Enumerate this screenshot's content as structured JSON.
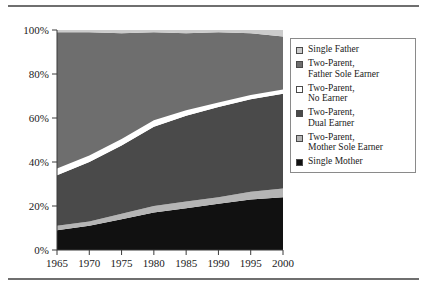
{
  "chart_data": {
    "type": "area",
    "stacked": true,
    "title": "",
    "subtitle": "",
    "xlabel": "",
    "ylabel": "",
    "x": [
      1965,
      1970,
      1975,
      1980,
      1985,
      1990,
      1995,
      2000
    ],
    "xtick_labels": [
      "1965",
      "1970",
      "1975",
      "1980",
      "1985",
      "1990",
      "1995",
      "2000"
    ],
    "xlim": [
      1965,
      2000
    ],
    "ylim": [
      0,
      100
    ],
    "ytick_labels": [
      "0%",
      "20%",
      "40%",
      "60%",
      "80%",
      "100%"
    ],
    "yticks": [
      0,
      20,
      40,
      60,
      80,
      100
    ],
    "grid": false,
    "legend_position": "right",
    "stack_order_bottom_to_top": [
      "Single Mother",
      "Two-Parent, Mother Sole Earner",
      "Two-Parent, Dual Earner",
      "Two-Parent, No Earner",
      "Two-Parent, Father Sole Earner",
      "Single Father"
    ],
    "series": [
      {
        "name": "Single Mother",
        "color": "#111111",
        "values": [
          9,
          11,
          14,
          17,
          19,
          21,
          23,
          24
        ]
      },
      {
        "name": "Two-Parent, Mother Sole Earner",
        "color": "#b5b5b5",
        "values": [
          2,
          2,
          2.5,
          3,
          3,
          3,
          3.5,
          4
        ]
      },
      {
        "name": "Two-Parent, Dual Earner",
        "color": "#4a4a4a",
        "values": [
          23,
          27,
          31,
          36,
          39,
          41,
          42,
          43
        ]
      },
      {
        "name": "Two-Parent, No Earner",
        "color": "#ffffff",
        "values": [
          3,
          3,
          3,
          3,
          2.5,
          2,
          2,
          2
        ]
      },
      {
        "name": "Two-Parent, Father Sole Earner",
        "color": "#6e6e6e",
        "values": [
          62,
          56,
          48,
          40,
          35,
          32,
          28,
          24
        ]
      },
      {
        "name": "Single Father",
        "color": "#cccccc",
        "values": [
          1,
          1,
          1.5,
          1.5,
          2,
          2.5,
          3,
          4
        ]
      }
    ],
    "cumulative_top_boundaries": {
      "single_mother": [
        9,
        11,
        14,
        17,
        19,
        21,
        23,
        24
      ],
      "mother_sole_earner": [
        11,
        13,
        16.5,
        20,
        22,
        24,
        26.5,
        28
      ],
      "dual_earner": [
        34,
        40,
        47.5,
        56,
        61,
        65,
        68.5,
        71
      ],
      "no_earner": [
        37,
        43,
        50.5,
        59,
        63.5,
        67,
        70.5,
        73
      ],
      "father_sole_earner": [
        99,
        99,
        98.5,
        99,
        98.5,
        99,
        98.5,
        97
      ],
      "single_father": [
        100,
        100,
        100,
        100,
        100,
        100,
        100,
        100
      ]
    }
  },
  "legend": {
    "items": [
      {
        "label": "Single Father",
        "color": "#cccccc"
      },
      {
        "label": "Two-Parent,\nFather Sole Earner",
        "color": "#6e6e6e"
      },
      {
        "label": "Two-Parent,\nNo Earner",
        "color": "#ffffff"
      },
      {
        "label": "Two-Parent,\nDual Earner",
        "color": "#4a4a4a"
      },
      {
        "label": "Two-Parent,\nMother Sole Earner",
        "color": "#b5b5b5"
      },
      {
        "label": "Single Mother",
        "color": "#111111"
      }
    ]
  },
  "axis": {
    "y_labels": [
      "100%",
      "80%",
      "60%",
      "40%",
      "20%",
      "0%"
    ],
    "x_labels": [
      "1965",
      "1970",
      "1975",
      "1980",
      "1985",
      "1990",
      "1995",
      "2000"
    ]
  }
}
